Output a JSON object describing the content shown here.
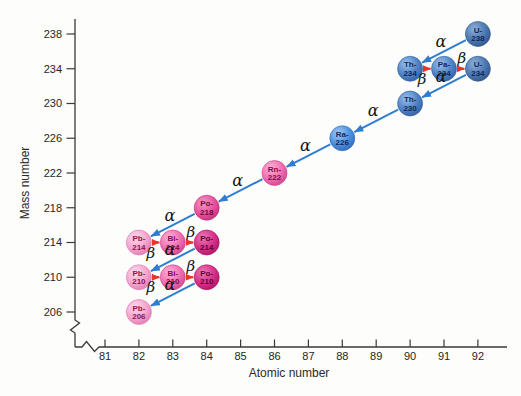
{
  "figure": {
    "background": "#fdfdfb"
  },
  "chart_data": {
    "type": "scatter",
    "xlabel": "Atomic number",
    "ylabel": "Mass number",
    "x_ticks": [
      81,
      82,
      83,
      84,
      85,
      86,
      87,
      88,
      89,
      90,
      91,
      92
    ],
    "y_ticks": [
      206,
      210,
      214,
      218,
      222,
      226,
      230,
      234,
      238
    ],
    "axis_breaks": {
      "x_axis": true,
      "y_axis": true
    },
    "legend": "none",
    "grid": false,
    "nuclides": [
      {
        "id": "U-238",
        "label_top": "U-",
        "label_bottom": "238",
        "z": 92,
        "a": 238,
        "palette": "blue_dark"
      },
      {
        "id": "Th-234",
        "label_top": "Th-",
        "label_bottom": "234",
        "z": 90,
        "a": 234,
        "palette": "blue_med"
      },
      {
        "id": "Pa-234",
        "label_top": "Pa-",
        "label_bottom": "234",
        "z": 91,
        "a": 234,
        "palette": "blue_med"
      },
      {
        "id": "U-234",
        "label_top": "U-",
        "label_bottom": "234",
        "z": 92,
        "a": 234,
        "palette": "blue_dark"
      },
      {
        "id": "Th-230",
        "label_top": "Th-",
        "label_bottom": "230",
        "z": 90,
        "a": 230,
        "palette": "blue_med"
      },
      {
        "id": "Ra-226",
        "label_top": "Ra-",
        "label_bottom": "226",
        "z": 88,
        "a": 226,
        "palette": "blue_bright"
      },
      {
        "id": "Rn-222",
        "label_top": "Rn-",
        "label_bottom": "222",
        "z": 86,
        "a": 222,
        "palette": "pink_med"
      },
      {
        "id": "Po-218",
        "label_top": "Po-",
        "label_bottom": "218",
        "z": 84,
        "a": 218,
        "palette": "pink_deep"
      },
      {
        "id": "Pb-214",
        "label_top": "Pb-",
        "label_bottom": "214",
        "z": 82,
        "a": 214,
        "palette": "pink_light"
      },
      {
        "id": "Bi-214",
        "label_top": "Bi-",
        "label_bottom": "214",
        "z": 83,
        "a": 214,
        "palette": "pink_med"
      },
      {
        "id": "Po-214",
        "label_top": "Po-",
        "label_bottom": "214",
        "z": 84,
        "a": 214,
        "palette": "magenta"
      },
      {
        "id": "Pb-210",
        "label_top": "Pb-",
        "label_bottom": "210",
        "z": 82,
        "a": 210,
        "palette": "pink_light"
      },
      {
        "id": "Bi-210",
        "label_top": "Bi-",
        "label_bottom": "210",
        "z": 83,
        "a": 210,
        "palette": "pink_med"
      },
      {
        "id": "Po-210",
        "label_top": "Po-",
        "label_bottom": "210",
        "z": 84,
        "a": 210,
        "palette": "magenta"
      },
      {
        "id": "Pb-206",
        "label_top": "Pb-",
        "label_bottom": "206",
        "z": 82,
        "a": 206,
        "palette": "pink_light"
      }
    ],
    "decays": [
      {
        "from": "U-238",
        "to": "Th-234",
        "type": "alpha",
        "label": "α",
        "label_side": "above"
      },
      {
        "from": "Th-234",
        "to": "Pa-234",
        "type": "beta",
        "label": "β",
        "label_side": "below"
      },
      {
        "from": "Pa-234",
        "to": "U-234",
        "type": "beta",
        "label": "β",
        "label_side": "above"
      },
      {
        "from": "U-234",
        "to": "Th-230",
        "type": "alpha",
        "label": "α",
        "label_side": "above"
      },
      {
        "from": "Th-230",
        "to": "Ra-226",
        "type": "alpha",
        "label": "α",
        "label_side": "above"
      },
      {
        "from": "Ra-226",
        "to": "Rn-222",
        "type": "alpha",
        "label": "α",
        "label_side": "above"
      },
      {
        "from": "Rn-222",
        "to": "Po-218",
        "type": "alpha",
        "label": "α",
        "label_side": "above"
      },
      {
        "from": "Po-218",
        "to": "Pb-214",
        "type": "alpha",
        "label": "α",
        "label_side": "above"
      },
      {
        "from": "Pb-214",
        "to": "Bi-214",
        "type": "beta",
        "label": "β",
        "label_side": "below"
      },
      {
        "from": "Bi-214",
        "to": "Po-214",
        "type": "beta",
        "label": "β",
        "label_side": "above"
      },
      {
        "from": "Po-214",
        "to": "Pb-210",
        "type": "alpha",
        "label": "α",
        "label_side": "above"
      },
      {
        "from": "Pb-210",
        "to": "Bi-210",
        "type": "beta",
        "label": "β",
        "label_side": "below"
      },
      {
        "from": "Bi-210",
        "to": "Po-210",
        "type": "beta",
        "label": "β",
        "label_side": "above"
      },
      {
        "from": "Po-210",
        "to": "Pb-206",
        "type": "alpha",
        "label": "α",
        "label_side": "above"
      }
    ]
  },
  "palette": {
    "blue_dark": {
      "hi": "#8fb0d8",
      "body": "#4e7cb3",
      "edge": "#2c4f86",
      "text": "#12245e"
    },
    "blue_med": {
      "hi": "#9cc0ea",
      "body": "#5286c8",
      "edge": "#2e5b9e",
      "text": "#12245e"
    },
    "blue_bright": {
      "hi": "#a5cdf5",
      "body": "#4e92e0",
      "edge": "#2b64b8",
      "text": "#12245e"
    },
    "pink_light": {
      "hi": "#fcd9ec",
      "body": "#f5aad0",
      "edge": "#dd74ad",
      "text": "#8f1252"
    },
    "pink_med": {
      "hi": "#f9b3d8",
      "body": "#f073b4",
      "edge": "#cb3e88",
      "text": "#7c0b46"
    },
    "pink_deep": {
      "hi": "#f498c7",
      "body": "#e9569f",
      "edge": "#c02a73",
      "text": "#6d0a3e"
    },
    "magenta": {
      "hi": "#eb7ab3",
      "body": "#d9348c",
      "edge": "#a60f60",
      "text": "#570333"
    }
  },
  "arrow_colors": {
    "alpha": "#2e7dd1",
    "beta": "#e8342b"
  },
  "axis_style": {
    "line_color": "#3a3a3a",
    "text_color": "#262626"
  }
}
